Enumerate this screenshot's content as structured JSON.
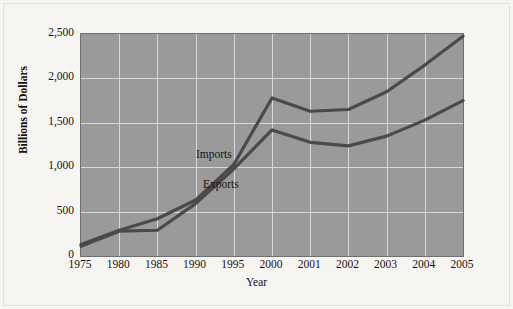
{
  "chart_data": {
    "type": "line",
    "title": "",
    "xlabel": "Year",
    "ylabel": "Billions of Dollars",
    "categories": [
      "1975",
      "1980",
      "1985",
      "1990",
      "1995",
      "2000",
      "2001",
      "2002",
      "2003",
      "2004",
      "2005"
    ],
    "x": [
      1975,
      1980,
      1985,
      1990,
      1995,
      2000,
      2001,
      2002,
      2003,
      2004,
      2005
    ],
    "ylim": [
      0,
      2500
    ],
    "yticks": [
      0,
      500,
      1000,
      1500,
      2000,
      2500
    ],
    "ytick_labels": [
      "0",
      "500",
      "1,000",
      "1,500",
      "2,000",
      "2,500"
    ],
    "grid": true,
    "legend_position": "inline-annotations",
    "series": [
      {
        "name": "Imports",
        "values": [
          130,
          290,
          420,
          630,
          1030,
          1780,
          1630,
          1650,
          1850,
          2150,
          2475
        ]
      },
      {
        "name": "Exports",
        "values": [
          110,
          280,
          290,
          590,
          980,
          1420,
          1280,
          1240,
          1350,
          1530,
          1750
        ]
      }
    ],
    "annotations": [
      {
        "text": "Imports",
        "series": "Imports"
      },
      {
        "text": "Exports",
        "series": "Exports"
      }
    ],
    "colors": {
      "plot_background": "#9a9a9a",
      "figure_background": "#f6f5f2",
      "gridline": "#d9d9d9",
      "line": "#4a4a4a",
      "axis": "#6f6f6f",
      "text": "#16120f"
    }
  },
  "axis": {
    "y_title": "Billions of Dollars",
    "x_title": "Year",
    "y_labels": [
      "2,500",
      "2,000",
      "1,500",
      "1,000",
      "500",
      "0"
    ],
    "x_labels": [
      "1975",
      "1980",
      "1985",
      "1990",
      "1995",
      "2000",
      "2001",
      "2002",
      "2003",
      "2004",
      "2005"
    ]
  },
  "annotations": {
    "imports_label": "Imports",
    "exports_label": "Exports"
  }
}
